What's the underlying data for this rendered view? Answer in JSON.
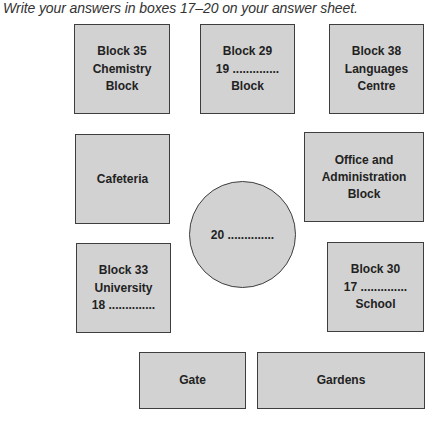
{
  "instruction": "Write your answers in boxes 17–20 on your answer sheet.",
  "colors": {
    "block_fill": "#d2d2d2",
    "block_border": "#3e3e3e",
    "text": "#222222"
  },
  "map": {
    "block35": {
      "lines": [
        "Block 35",
        "Chemistry",
        "Block"
      ]
    },
    "block29": {
      "lines": [
        "Block 29",
        "19 ..............",
        "Block"
      ]
    },
    "block38": {
      "lines": [
        "Block 38",
        "Languages",
        "Centre"
      ]
    },
    "cafeteria": {
      "lines": [
        "Cafeteria"
      ]
    },
    "office": {
      "lines": [
        "Office and",
        "Administration",
        "Block"
      ]
    },
    "center_circle": {
      "label": "20 .............."
    },
    "block33": {
      "lines": [
        "Block 33",
        "University",
        "18 .............."
      ]
    },
    "block30": {
      "lines": [
        "Block 30",
        "17 ..............",
        "School"
      ]
    },
    "gate": {
      "lines": [
        "Gate"
      ]
    },
    "gardens": {
      "lines": [
        "Gardens"
      ]
    }
  },
  "questions": [
    {
      "number": 17,
      "location": "Block 30"
    },
    {
      "number": 18,
      "location": "Block 33"
    },
    {
      "number": 19,
      "location": "Block 29"
    },
    {
      "number": 20,
      "location": "Centre circle"
    }
  ]
}
